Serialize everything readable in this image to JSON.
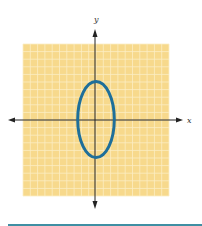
{
  "chart_data": {
    "type": "line",
    "title": "",
    "xlabel": "x",
    "ylabel": "y",
    "xlim": [
      -10,
      10
    ],
    "ylim": [
      -10,
      10
    ],
    "grid": true,
    "legend": null,
    "tick_labels_shown": false,
    "series": [
      {
        "name": "ellipse",
        "shape": "ellipse",
        "center": [
          0,
          0
        ],
        "semi_axis_x": 2.5,
        "semi_axis_y": 5,
        "equation": "x^2/6.25 + y^2/25 = 1",
        "color": "#1e6f9a"
      }
    ]
  },
  "labels": {
    "x_axis": "x",
    "y_axis": "y"
  },
  "colors": {
    "grid_background": "#f7d98c",
    "grid_lines": "#fbeec4",
    "axes": "#222222",
    "curve": "#1e6f9a",
    "bottom_rule": "#3f8fa3"
  }
}
